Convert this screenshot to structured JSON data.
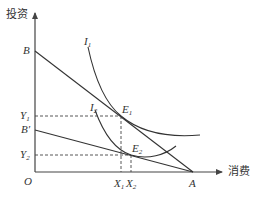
{
  "axes": {
    "y_label": "投资",
    "x_label": "消费",
    "origin_label": "O"
  },
  "points": {
    "B": "B",
    "B_prime": "B′",
    "A": "A",
    "Y1": "Y",
    "Y1_sub": "1",
    "Y2": "Y",
    "Y2_sub": "2",
    "X1": "X",
    "X1_sub": "1",
    "X2": "X",
    "X2_sub": "2",
    "E1": "E",
    "E1_sub": "1",
    "E2": "E",
    "E2_sub": "2"
  },
  "curves": {
    "I1": "I",
    "I1_sub": "1",
    "I2": "I",
    "I2_sub": "2"
  },
  "colors": {
    "line": "#333333",
    "axis": "#444444"
  }
}
